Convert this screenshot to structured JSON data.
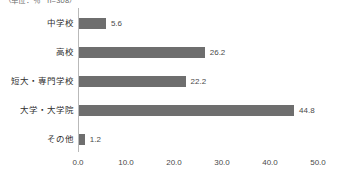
{
  "annotation": {
    "unit_note": "（単位：％　n=308）"
  },
  "chart_data": {
    "type": "bar",
    "orientation": "horizontal",
    "title": "",
    "subtitle": "",
    "xlabel": "",
    "ylabel": "",
    "categories": [
      "中学校",
      "高校",
      "短大・専門学校",
      "大学・大学院",
      "その他"
    ],
    "values": [
      5.6,
      26.2,
      22.2,
      44.8,
      1.2
    ],
    "value_labels": [
      "5.6",
      "26.2",
      "22.2",
      "44.8",
      "1.2"
    ],
    "xticks": [
      0.0,
      10.0,
      20.0,
      30.0,
      40.0,
      50.0
    ],
    "xtick_labels": [
      "0.0",
      "10.0",
      "20.0",
      "30.0",
      "40.0",
      "50.0"
    ],
    "xlim": [
      0,
      50
    ],
    "grid": false,
    "legend": null,
    "bar_color": "#6e6e6e",
    "axis_color": "#b9b9b9",
    "background": "#ffffff"
  }
}
